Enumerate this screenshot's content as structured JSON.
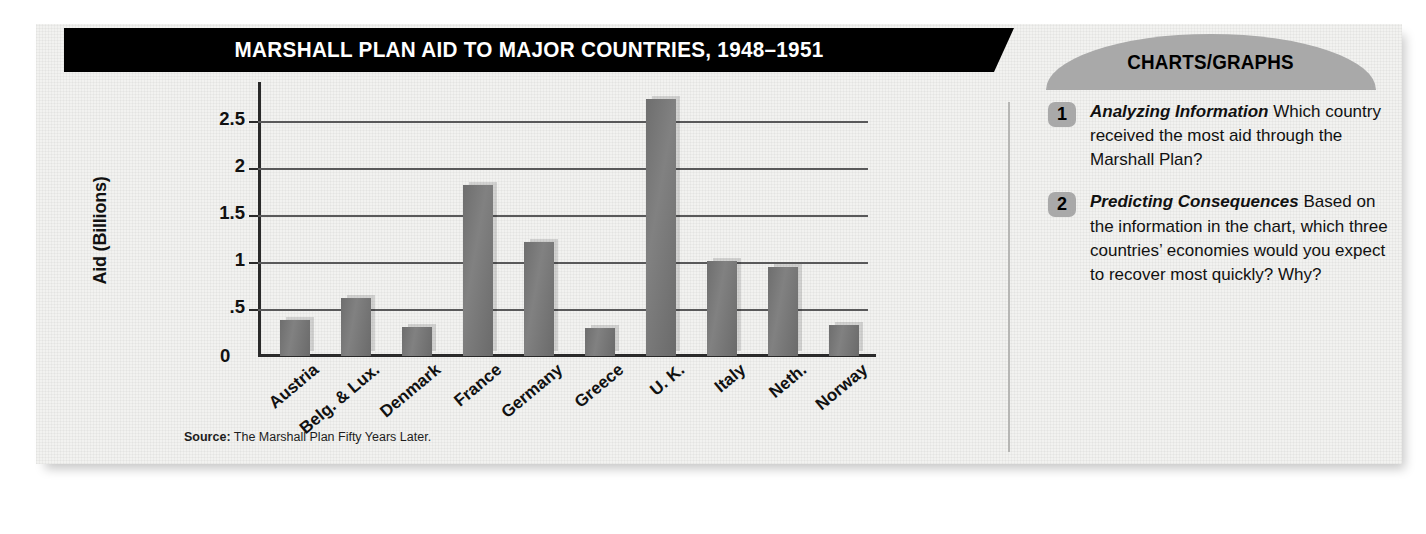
{
  "header": {
    "title": "MARSHALL PLAN AID TO MAJOR COUNTRIES, 1948–1951",
    "section_label": "CHARTS/GRAPHS"
  },
  "chart_data": {
    "type": "bar",
    "title": "MARSHALL PLAN AID TO MAJOR COUNTRIES, 1948–1951",
    "xlabel": "",
    "ylabel": "Aid (Billions)",
    "categories": [
      "Austria",
      "Belg. & Lux.",
      "Denmark",
      "France",
      "Germany",
      "Greece",
      "U. K.",
      "Italy",
      "Neth.",
      "Norway"
    ],
    "values": [
      0.38,
      0.62,
      0.31,
      1.82,
      1.22,
      0.3,
      2.74,
      1.01,
      0.95,
      0.33
    ],
    "ylim": [
      0,
      2.75
    ],
    "yticks": [
      2.5,
      2,
      1.5,
      1,
      0.5,
      0
    ],
    "ytick_labels": [
      "2.5",
      "2",
      "1.5",
      "1",
      ".5",
      "0"
    ],
    "grid": true,
    "legend": "none",
    "bar_color": "#767676",
    "source": {
      "label": "Source:",
      "text": " The Marshall Plan Fifty Years Later."
    }
  },
  "questions": [
    {
      "number": "1",
      "lead": "Analyzing Information",
      "body": " Which country received the most aid through the Marshall Plan?"
    },
    {
      "number": "2",
      "lead": "Predicting Consequences",
      "body": " Based on the information in the chart, which three countries’ economies would you expect to recover most quickly? Why?"
    }
  ],
  "colors": {
    "title_bar": "#000000",
    "arch": "#a9a9a9",
    "card": "#f2f2f0",
    "axis": "#2a2a2a"
  }
}
